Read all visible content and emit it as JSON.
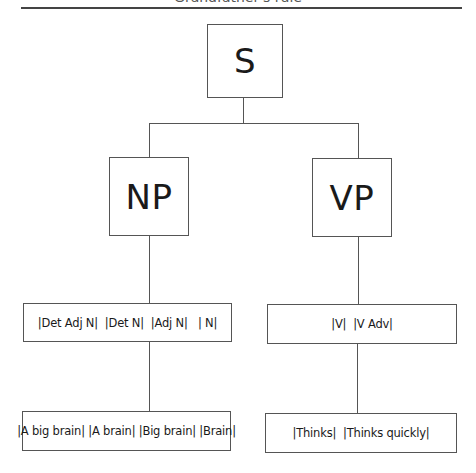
{
  "title": "Grandfather's rule",
  "tree": {
    "root": {
      "label": "S"
    },
    "left_branch": {
      "node": {
        "label": "NP"
      },
      "rules": {
        "label": "|Det Adj N|  |Det N|  |Adj N|   | N|"
      },
      "examples": {
        "label": "|A big brain| |A brain| |Big brain| |Brain|"
      }
    },
    "right_branch": {
      "node": {
        "label": "VP"
      },
      "rules": {
        "label": "|V|  |V Adv|"
      },
      "examples": {
        "label": "|Thinks|  |Thinks quickly|"
      }
    }
  },
  "colors": {
    "line": "#555555",
    "text": "#1a1a1a",
    "background": "#ffffff"
  }
}
